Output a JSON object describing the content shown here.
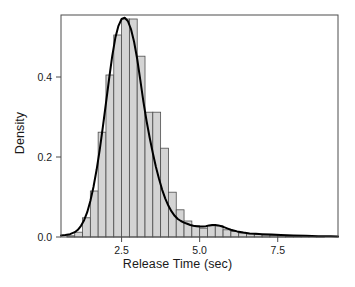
{
  "chart_data": {
    "type": "histogram",
    "title": "",
    "subtitle": "",
    "xlabel": "Release Time (sec)",
    "ylabel": "Density",
    "xlim": [
      0.56,
      9.43
    ],
    "ylim": [
      0.0,
      0.555
    ],
    "xticks": [
      2.5,
      5.0,
      7.5
    ],
    "xtick_labels": [
      "2.5",
      "5.0",
      "7.5"
    ],
    "yticks": [
      0.0,
      0.2,
      0.4
    ],
    "ytick_labels": [
      "0.0",
      "0.2",
      "0.4"
    ],
    "grid": false,
    "legend": null,
    "bin_width": 0.25,
    "bin_edges": [
      0.75,
      1.0,
      1.25,
      1.5,
      1.75,
      2.0,
      2.25,
      2.5,
      2.75,
      3.0,
      3.25,
      3.5,
      3.75,
      4.0,
      4.25,
      4.5,
      4.75,
      5.0,
      5.25,
      5.5,
      5.75,
      6.0,
      6.25,
      6.5,
      6.75,
      7.0,
      7.25,
      7.5,
      7.75,
      8.0,
      8.25,
      8.5,
      8.75,
      9.0
    ],
    "bin_centers": [
      0.875,
      1.125,
      1.375,
      1.625,
      1.875,
      2.125,
      2.375,
      2.625,
      2.875,
      3.125,
      3.375,
      3.625,
      3.875,
      4.125,
      4.375,
      4.625,
      4.875,
      5.125,
      5.375,
      5.625,
      5.875,
      6.125,
      6.375,
      6.625,
      6.875,
      7.125,
      7.375,
      7.625,
      7.875,
      8.125,
      8.375,
      8.625,
      8.875
    ],
    "bar_heights": [
      0.003,
      0.012,
      0.048,
      0.115,
      0.262,
      0.405,
      0.505,
      0.545,
      0.545,
      0.452,
      0.312,
      0.312,
      0.222,
      0.112,
      0.068,
      0.04,
      0.028,
      0.022,
      0.028,
      0.028,
      0.018,
      0.014,
      0.01,
      0.008,
      0.006,
      0.005,
      0.004,
      0.003,
      0.002,
      0.002,
      0.001,
      0.001,
      0.001
    ],
    "bar_fill_color": "#d4d4d4",
    "bar_edge_color": "#4d4d4d",
    "density_curve": {
      "label": "kernel density estimate",
      "color": "#000000",
      "line_width": 2.0,
      "x": [
        0.56,
        0.7,
        0.85,
        1.0,
        1.1,
        1.2,
        1.3,
        1.4,
        1.5,
        1.6,
        1.7,
        1.8,
        1.9,
        2.0,
        2.1,
        2.2,
        2.3,
        2.4,
        2.5,
        2.6,
        2.7,
        2.8,
        2.9,
        3.0,
        3.1,
        3.2,
        3.3,
        3.4,
        3.5,
        3.6,
        3.7,
        3.8,
        3.9,
        4.0,
        4.1,
        4.2,
        4.3,
        4.4,
        4.5,
        4.6,
        4.7,
        4.8,
        4.9,
        5.0,
        5.1,
        5.2,
        5.3,
        5.4,
        5.5,
        5.6,
        5.7,
        5.8,
        5.9,
        6.0,
        6.2,
        6.4,
        6.6,
        6.8,
        7.0,
        7.3,
        7.6,
        8.0,
        8.4,
        8.8,
        9.2,
        9.43
      ],
      "y": [
        0.004,
        0.005,
        0.007,
        0.012,
        0.018,
        0.028,
        0.042,
        0.062,
        0.09,
        0.125,
        0.168,
        0.218,
        0.275,
        0.335,
        0.395,
        0.452,
        0.498,
        0.528,
        0.545,
        0.548,
        0.54,
        0.52,
        0.488,
        0.445,
        0.392,
        0.338,
        0.29,
        0.248,
        0.21,
        0.175,
        0.145,
        0.118,
        0.096,
        0.078,
        0.064,
        0.053,
        0.045,
        0.04,
        0.036,
        0.033,
        0.03,
        0.028,
        0.027,
        0.026,
        0.026,
        0.027,
        0.029,
        0.03,
        0.03,
        0.029,
        0.027,
        0.024,
        0.021,
        0.018,
        0.014,
        0.011,
        0.009,
        0.008,
        0.007,
        0.006,
        0.005,
        0.004,
        0.003,
        0.002,
        0.002,
        0.001
      ]
    }
  },
  "axes": {
    "frame_color": "#4d4d4d",
    "tick_color": "#4d4d4d",
    "text_color": "#1a1a1a"
  }
}
